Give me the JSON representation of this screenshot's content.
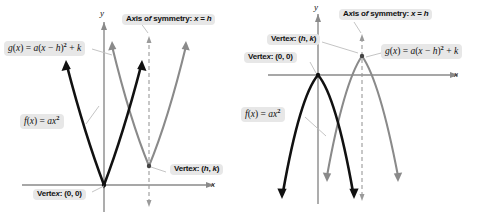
{
  "figure": {
    "panels": [
      {
        "id": "panel-left",
        "opening": "upward",
        "axis_labels": {
          "x": "x",
          "y": "y"
        },
        "labels": {
          "g_function": "g(x) = a(x − h)² + k",
          "f_function": "f(x) = ax²",
          "axis_of_symmetry": "Axis of symmetry: x = h",
          "vertex_origin": "Vertex: (0, 0)",
          "vertex_hk": "Vertex: (h, k)"
        }
      },
      {
        "id": "panel-right",
        "opening": "downward",
        "axis_labels": {
          "x": "x",
          "y": "y"
        },
        "labels": {
          "g_function": "g(x) = a(x − h)² + k",
          "f_function": "f(x) = ax²",
          "axis_of_symmetry": "Axis of symmetry: x = h",
          "vertex_origin": "Vertex: (0, 0)",
          "vertex_hk": "Vertex: (h, k)"
        }
      }
    ]
  },
  "chart_data": [
    {
      "type": "line",
      "title": "a > 0: parabolas open upward",
      "xlabel": "x",
      "ylabel": "y",
      "xlim": [
        -5,
        7
      ],
      "ylim": [
        -1.2,
        9
      ],
      "grid": false,
      "legend": "inline annotations",
      "series": [
        {
          "name": "f(x) = ax²",
          "color": "#111111",
          "vertex": [
            0,
            0
          ],
          "equation": "f(x) = ax^2",
          "a": 1,
          "h": 0,
          "k": 0,
          "x": [
            -2.6,
            -2.0,
            -1.3,
            -0.6,
            0,
            0.6,
            1.3,
            2.0,
            2.6
          ],
          "y": [
            6.76,
            4.0,
            1.69,
            0.36,
            0,
            0.36,
            1.69,
            4.0,
            6.76
          ]
        },
        {
          "name": "g(x) = a(x − h)² + k",
          "color": "#8a8a8a",
          "vertex": [
            2.6,
            1.1
          ],
          "equation": "g(x) = a(x - h)^2 + k",
          "a": 1,
          "h": 2.6,
          "k": 1.1,
          "x": [
            0.0,
            0.6,
            1.3,
            2.0,
            2.6,
            3.2,
            3.9,
            4.6,
            5.2
          ],
          "y": [
            7.86,
            5.1,
            2.79,
            1.46,
            1.1,
            1.46,
            2.79,
            5.1,
            7.86
          ]
        }
      ],
      "annotations": [
        {
          "text": "Axis of symmetry: x = h",
          "type": "vertical-dashed-line",
          "at_x": 2.6
        },
        {
          "text": "Vertex: (0, 0)",
          "points_to": [
            0,
            0
          ]
        },
        {
          "text": "Vertex: (h, k)",
          "points_to": [
            2.6,
            1.1
          ]
        },
        {
          "text": "f(x) = ax²",
          "points_to": "black-curve"
        },
        {
          "text": "g(x) = a(x − h)² + k",
          "points_to": "gray-curve"
        }
      ]
    },
    {
      "type": "line",
      "title": "a < 0: parabolas open downward",
      "xlabel": "x",
      "ylabel": "y",
      "xlim": [
        -5,
        7
      ],
      "ylim": [
        -9,
        2.2
      ],
      "grid": false,
      "legend": "inline annotations",
      "series": [
        {
          "name": "f(x) = ax²",
          "color": "#111111",
          "vertex": [
            0,
            0
          ],
          "equation": "f(x) = ax^2",
          "a": -1,
          "h": 0,
          "k": 0,
          "x": [
            -2.6,
            -2.0,
            -1.3,
            -0.6,
            0,
            0.6,
            1.3,
            2.0,
            2.6
          ],
          "y": [
            -6.76,
            -4.0,
            -1.69,
            -0.36,
            0,
            -0.36,
            -1.69,
            -4.0,
            -6.76
          ]
        },
        {
          "name": "g(x) = a(x − h)² + k",
          "color": "#8a8a8a",
          "vertex": [
            2.6,
            1.1
          ],
          "equation": "g(x) = a(x - h)^2 + k",
          "a": -1,
          "h": 2.6,
          "k": 1.1,
          "x": [
            0.0,
            0.6,
            1.3,
            2.0,
            2.6,
            3.2,
            3.9,
            4.6,
            5.2
          ],
          "y": [
            -5.66,
            -2.9,
            -0.59,
            0.74,
            1.1,
            0.74,
            -0.59,
            -2.9,
            -5.66
          ]
        }
      ],
      "annotations": [
        {
          "text": "Axis of symmetry: x = h",
          "type": "vertical-dashed-line",
          "at_x": 2.6
        },
        {
          "text": "Vertex: (0, 0)",
          "points_to": [
            0,
            0
          ]
        },
        {
          "text": "Vertex: (h, k)",
          "points_to": [
            2.6,
            1.1
          ]
        },
        {
          "text": "f(x) = ax²",
          "points_to": "black-curve"
        },
        {
          "text": "g(x) = a(x − h)² + k",
          "points_to": "gray-curve"
        }
      ]
    }
  ]
}
